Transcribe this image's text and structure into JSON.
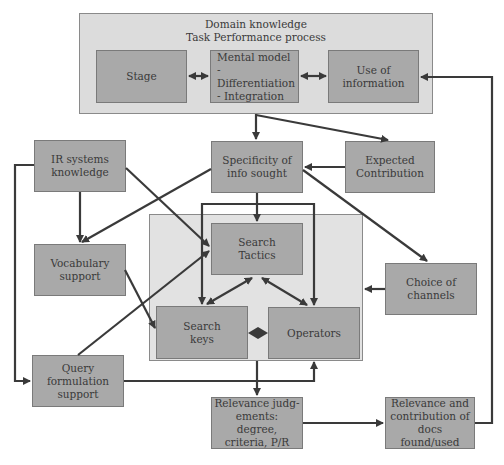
{
  "diagram": {
    "outer_group": {
      "title_line1": "Domain knowledge",
      "title_line2": "Task Performance process",
      "title": "Domain knowledge\nTask Performance process"
    },
    "search_group": {
      "label": ""
    },
    "nodes": {
      "stage": "Stage",
      "mental_model": "Mental model\n- Differentiation\n- Integration",
      "use_of_information": "Use of\ninformation",
      "ir_systems_knowledge": "IR systems\nknowledge",
      "specificity": "Specificity of\ninfo sought",
      "expected_contribution": "Expected\nContribution",
      "vocabulary_support": "Vocabulary\nsupport",
      "search_tactics": "Search\nTactics",
      "choice_of_channels": "Choice of\nchannels",
      "search_keys": "Search\nkeys",
      "operators": "Operators",
      "query_formulation_support": "Query\nformulation\nsupport",
      "relevance_judgements": "Relevance judg-\nements: degree,\ncriteria, P/R",
      "relevance_contribution": "Relevance and\ncontribution of\ndocs found/used"
    },
    "colors": {
      "node_fill": "#a9a9a9",
      "group_fill": "#dcdcdc",
      "line": "#3a3a3a",
      "text": "#3a3a3a"
    }
  }
}
